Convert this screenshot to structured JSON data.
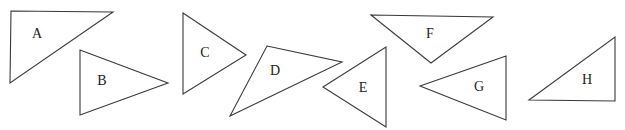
{
  "diagram": {
    "stroke_color": "#3a3a3a",
    "fill_color": "#ffffff",
    "triangles": [
      {
        "label": "A",
        "points": "11,11 113,12 10,83",
        "label_pos": [
          37,
          35
        ]
      },
      {
        "label": "B",
        "points": "80,50 168,83 80,115",
        "label_pos": [
          102,
          82
        ]
      },
      {
        "label": "C",
        "points": "183,13 246,55 183,94",
        "label_pos": [
          205,
          54
        ]
      },
      {
        "label": "D",
        "points": "267,46 342,62 230,116",
        "label_pos": [
          275,
          72
        ]
      },
      {
        "label": "E",
        "points": "323,87 386,47 386,127",
        "label_pos": [
          363,
          89
        ]
      },
      {
        "label": "F",
        "points": "371,15 493,17 431,63",
        "label_pos": [
          430,
          35
        ]
      },
      {
        "label": "G",
        "points": "420,86 506,56 506,120",
        "label_pos": [
          479,
          88
        ]
      },
      {
        "label": "H",
        "points": "529,100 615,37 615,101",
        "label_pos": [
          587,
          81
        ]
      }
    ]
  }
}
